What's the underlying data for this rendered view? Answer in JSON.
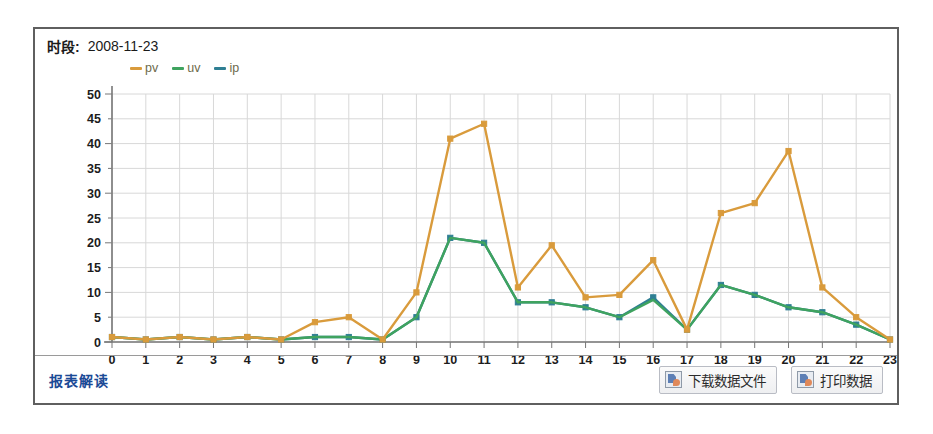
{
  "header": {
    "label": "时段:",
    "value": "2008-11-23"
  },
  "footer": {
    "report_link": "报表解读",
    "buttons": [
      {
        "label": "下载数据文件",
        "icon": "download-data-icon"
      },
      {
        "label": "打印数据",
        "icon": "print-data-icon"
      }
    ]
  },
  "colors": {
    "pv": "#d99b3c",
    "uv": "#3fa35f",
    "ip": "#2f7f93",
    "grid": "#d8d8d8",
    "axis": "#777777",
    "panel_border": "#5f5f5f",
    "link": "#1b4a96"
  },
  "chart_data": {
    "type": "line",
    "title": "",
    "xlabel": "",
    "ylabel": "",
    "x": [
      0,
      1,
      2,
      3,
      4,
      5,
      6,
      7,
      8,
      9,
      10,
      11,
      12,
      13,
      14,
      15,
      16,
      17,
      18,
      19,
      20,
      21,
      22,
      23
    ],
    "xtick_labels": [
      "0",
      "1",
      "2",
      "3",
      "4",
      "5",
      "6",
      "7",
      "8",
      "9",
      "10",
      "11",
      "12",
      "13",
      "14",
      "15",
      "16",
      "17",
      "18",
      "19",
      "20",
      "21",
      "22",
      "23"
    ],
    "ytick_labels": [
      "0",
      "5",
      "10",
      "15",
      "20",
      "25",
      "30",
      "35",
      "40",
      "45",
      "50"
    ],
    "ylim": [
      0,
      50
    ],
    "ytick_step": 5,
    "grid": true,
    "legend_position": "top-left",
    "series": [
      {
        "name": "pv",
        "color": "#d99b3c",
        "values": [
          1,
          0.5,
          1,
          0.5,
          1,
          0.5,
          4,
          5,
          0.5,
          10,
          41,
          44,
          11,
          19.5,
          9,
          9.5,
          16.5,
          2.5,
          26,
          28,
          38.5,
          11,
          5,
          0.5
        ]
      },
      {
        "name": "uv",
        "color": "#3fa35f",
        "values": [
          1,
          0.5,
          1,
          0.5,
          1,
          0.5,
          1,
          1,
          0.5,
          5,
          21,
          20,
          8,
          8,
          7,
          5,
          8.5,
          2.5,
          11.5,
          9.5,
          7,
          6,
          3.5,
          0.5
        ]
      },
      {
        "name": "ip",
        "color": "#2f7f93",
        "values": [
          1,
          0.5,
          1,
          0.5,
          1,
          0.5,
          1,
          1,
          0.5,
          5,
          21,
          20,
          8,
          8,
          7,
          5,
          9,
          2.5,
          11.5,
          9.5,
          7,
          6,
          3.5,
          0.5
        ]
      }
    ]
  }
}
